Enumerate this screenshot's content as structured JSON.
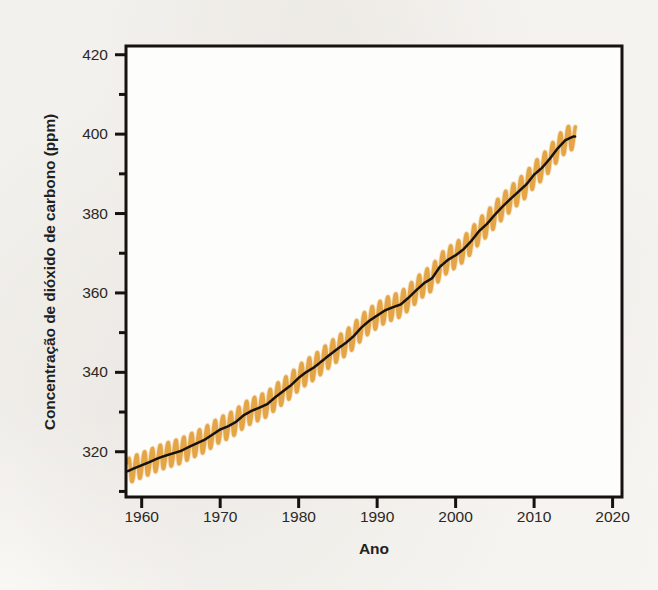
{
  "chart_data": {
    "type": "line",
    "title": "",
    "xlabel": "Ano",
    "ylabel": "Concentração de dióxido de carbono (ppm)",
    "xlim": [
      1958,
      2021.2
    ],
    "ylim": [
      308.6,
      422.2
    ],
    "grid": false,
    "legend": "none",
    "xticks": [
      1960,
      1970,
      1980,
      1990,
      2000,
      2010,
      2020
    ],
    "xtick_labels": [
      "1960",
      "1970",
      "1980",
      "1990",
      "2000",
      "2010",
      "2020"
    ],
    "yticks": [
      320,
      340,
      360,
      380,
      400,
      420
    ],
    "ytick_labels": [
      "320",
      "340",
      "360",
      "380",
      "400",
      "420"
    ],
    "y_minor_ticks": [
      310,
      330,
      350,
      370,
      390,
      410
    ],
    "series": [
      {
        "name": "Concentração mensal de CO2 (oscilação sazonal)",
        "color": "#e3a243",
        "type": "seasonal-oscillation",
        "seasonal_amplitude_ppm": 3.1
      },
      {
        "name": "Média anual suavizada de CO2",
        "color": "#17120f",
        "type": "trend-line"
      }
    ],
    "x": [
      1958,
      1959,
      1960,
      1961,
      1962,
      1963,
      1964,
      1965,
      1966,
      1967,
      1968,
      1969,
      1970,
      1971,
      1972,
      1973,
      1974,
      1975,
      1976,
      1977,
      1978,
      1979,
      1980,
      1981,
      1982,
      1983,
      1984,
      1985,
      1986,
      1987,
      1988,
      1989,
      1990,
      1991,
      1992,
      1993,
      1994,
      1995,
      1996,
      1997,
      1998,
      1999,
      2000,
      2001,
      2002,
      2003,
      2004,
      2005,
      2006,
      2007,
      2008,
      2009,
      2010,
      2011,
      2012,
      2013,
      2014,
      2015
    ],
    "values": [
      315.0,
      315.6,
      316.6,
      317.3,
      318.4,
      319.0,
      319.6,
      320.0,
      321.4,
      322.2,
      323.0,
      324.6,
      325.7,
      326.3,
      327.5,
      329.7,
      330.2,
      331.1,
      332.0,
      333.8,
      335.4,
      336.8,
      338.7,
      340.1,
      341.4,
      343.0,
      344.6,
      346.0,
      347.4,
      349.2,
      351.6,
      353.1,
      354.4,
      355.6,
      356.4,
      357.1,
      358.8,
      360.8,
      362.6,
      363.7,
      366.7,
      368.4,
      369.6,
      371.1,
      373.2,
      375.8,
      377.5,
      379.8,
      381.9,
      383.8,
      385.6,
      387.4,
      389.9,
      391.6,
      393.9,
      396.5,
      398.6,
      400.8
    ],
    "annual_trend": [
      314.9,
      315.8,
      316.6,
      317.4,
      318.3,
      319.0,
      319.6,
      320.2,
      321.2,
      322.1,
      323.0,
      324.3,
      325.6,
      326.4,
      327.5,
      329.2,
      330.3,
      331.1,
      332.0,
      333.7,
      335.2,
      336.7,
      338.6,
      340.1,
      341.3,
      342.9,
      344.5,
      346.0,
      347.4,
      349.1,
      351.3,
      353.0,
      354.3,
      355.6,
      356.4,
      357.1,
      358.8,
      360.7,
      362.5,
      363.7,
      366.6,
      368.3,
      369.5,
      371.0,
      373.1,
      375.6,
      377.4,
      379.7,
      381.8,
      383.7,
      385.5,
      387.3,
      389.8,
      391.5,
      393.8,
      396.4,
      398.5,
      399.4
    ]
  }
}
